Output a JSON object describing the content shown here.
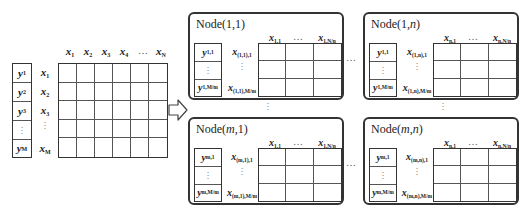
{
  "diagram": {
    "source": {
      "y_vector": [
        "y1",
        "y2",
        "y3",
        "⋮",
        "yM"
      ],
      "row_labels": [
        "x1",
        "x2",
        "x3",
        "⋮",
        "xM"
      ],
      "column_headers": [
        "x1",
        "x2",
        "x3",
        "x4",
        "…",
        "xN"
      ],
      "grid_rows": 5,
      "grid_cols": 6
    },
    "arrow": {
      "direction": "right",
      "icon": "hollow-right-arrow-icon"
    },
    "nodes": [
      {
        "title": "Node(1,1)",
        "title_base": "Node(",
        "title_i": "1",
        "title_j": "1",
        "col_headers": [
          "x_{1,1}",
          "…",
          "x_{1,N/n}"
        ],
        "y_labels": [
          "y_{1,1}",
          "⋮",
          "y_{1,M/m}"
        ],
        "row_labels": [
          "x_{(1,1),1}",
          "⋮",
          "x_{(1,1),M/m}"
        ]
      },
      {
        "title": "Node(1,n)",
        "title_base": "Node(",
        "title_i": "1",
        "title_j": "n",
        "col_headers": [
          "x_{n,1}",
          "…",
          "x_{n,N/n}"
        ],
        "y_labels": [
          "y_{1,1}",
          "⋮",
          "y_{1,M/m}"
        ],
        "row_labels": [
          "x_{(1,n),1}",
          "⋮",
          "x_{(1,n),M/m}"
        ]
      },
      {
        "title": "Node(m,1)",
        "title_base": "Node(",
        "title_i": "m",
        "title_j": "1",
        "col_headers": [
          "x_{1,1}",
          "…",
          "x_{1,N/n}"
        ],
        "y_labels": [
          "y_{m,1}",
          "⋮",
          "y_{m,M/m}"
        ],
        "row_labels": [
          "x_{(m,1),1}",
          "⋮",
          "x_{(m,1),M/m}"
        ]
      },
      {
        "title": "Node(m,n)",
        "title_base": "Node(",
        "title_i": "m",
        "title_j": "n",
        "col_headers": [
          "x_{n,1}",
          "…",
          "x_{n,N/n}"
        ],
        "y_labels": [
          "y_{m,1}",
          "⋮",
          "y_{m,M/m}"
        ],
        "row_labels": [
          "x_{(m,n),1}",
          "⋮",
          "x_{(m,n),M/m}"
        ]
      }
    ],
    "ellipsis_h": "…",
    "ellipsis_v": "⋮",
    "colors": {
      "stroke": "#333333",
      "background": "#ffffff",
      "text": "#222222"
    }
  }
}
